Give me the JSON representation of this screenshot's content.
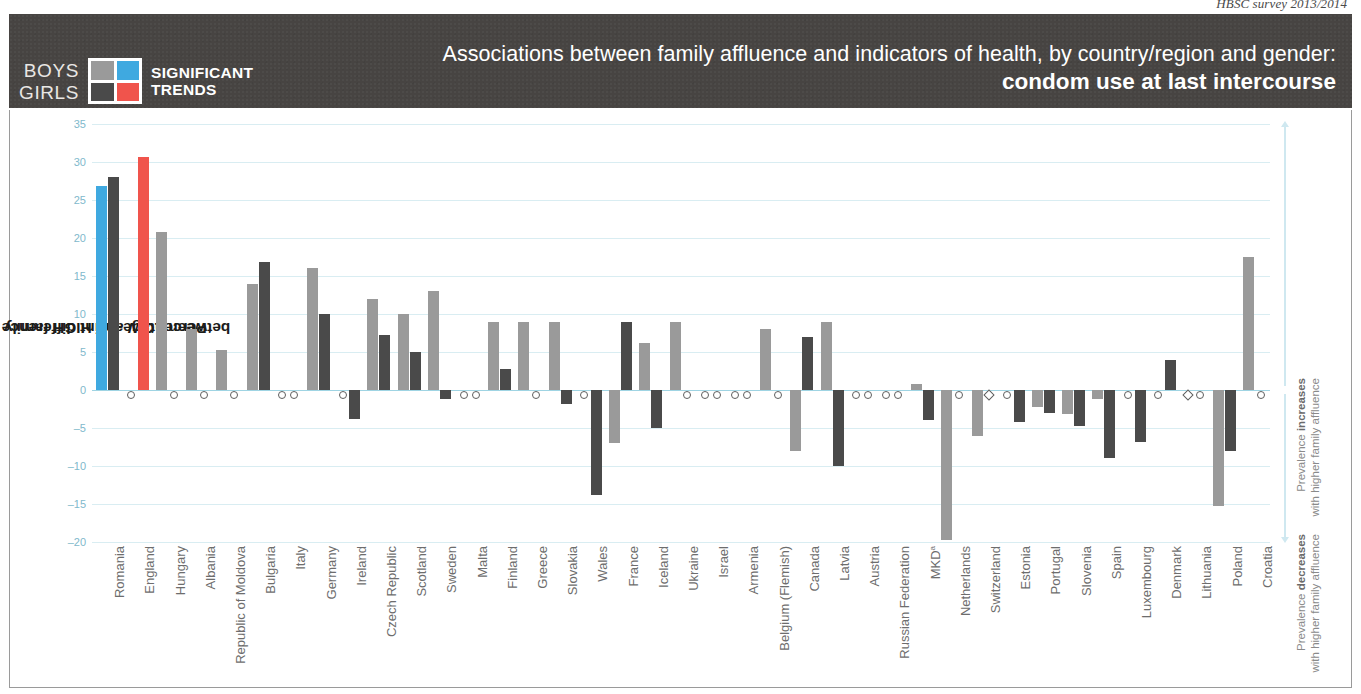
{
  "source_note": "HBSC survey 2013/2014",
  "title": {
    "main": "Associations between family affluence and indicators of health, by country/region and gender:",
    "subject": "condom use at last intercourse"
  },
  "legend": {
    "row_labels": [
      "BOYS",
      "GIRLS"
    ],
    "caption": [
      "SIGNIFICANT",
      "TRENDS"
    ],
    "swatches": {
      "boys_nonsignificant": "#9a9a9a",
      "boys_significant": "#3fa9e0",
      "girls_nonsignificant": "#4a4a4a",
      "girls_significant": "#f0544c"
    }
  },
  "annotations": {
    "increase": "Prevalence <b>increases</b><br>with higher family affluence",
    "decrease": "Prevalence <b>decreases</b><br>with higher family affluence"
  },
  "chart_data": {
    "type": "bar",
    "title": "Associations between family affluence and indicators of health, by country/region and gender: condom use at last intercourse",
    "ylabel_line1": "Percentage-point difference in prevalence",
    "ylabel_line2": "between LOW and HIGH family affluence groups",
    "xlabel": "",
    "ylim": [
      -20,
      35
    ],
    "yticks": [
      35,
      30,
      25,
      20,
      15,
      10,
      5,
      0,
      -5,
      -10,
      -15,
      -20
    ],
    "grid": true,
    "legend_position": "header",
    "categories": [
      "Romania",
      "England",
      "Hungary",
      "Albania",
      "Republic of Moldova",
      "Bulgaria",
      "Italy",
      "Germany",
      "Ireland",
      "Czech Republic",
      "Scotland",
      "Sweden",
      "Malta",
      "Finland",
      "Greece",
      "Slovakia",
      "Wales",
      "France",
      "Iceland",
      "Ukraine",
      "Israel",
      "Armenia",
      "Belgium (Flemish)",
      "Canada",
      "Latvia",
      "Austria",
      "Russian Federation",
      "MKD",
      "Netherlands",
      "Switzerland",
      "Estonia",
      "Portugal",
      "Slovenia",
      "Spain",
      "Luxembourg",
      "Denmark",
      "Lithuania",
      "Poland",
      "Croatia"
    ],
    "category_footnotes": {
      "MKD": "a"
    },
    "series": [
      {
        "name": "Boys",
        "values": [
          26.8,
          0,
          20.8,
          8.0,
          5.2,
          14.0,
          0,
          16.0,
          0,
          12.0,
          10.0,
          13.0,
          0,
          9.0,
          9.0,
          9.0,
          0,
          -7.0,
          6.2,
          9.0,
          0,
          0,
          8.0,
          -8.0,
          9.0,
          0,
          0,
          0.8,
          -19.8,
          -6.0,
          0,
          -2.2,
          -3.2,
          -1.2,
          0,
          0,
          0,
          -15.2,
          17.5
        ],
        "significant": [
          true,
          false,
          false,
          false,
          false,
          false,
          false,
          false,
          false,
          false,
          false,
          false,
          false,
          false,
          false,
          false,
          false,
          false,
          false,
          false,
          false,
          false,
          false,
          false,
          false,
          false,
          false,
          false,
          false,
          false,
          false,
          false,
          false,
          false,
          false,
          false,
          false,
          false,
          false
        ],
        "markers": [
          "",
          "circle",
          "",
          "",
          "",
          "",
          "circle",
          "",
          "circle",
          "",
          "",
          "",
          "circle",
          "",
          "",
          "",
          "circle",
          "",
          "",
          "",
          "circle",
          "circle",
          "",
          "",
          "",
          "circle",
          "circle",
          "",
          "",
          "",
          "circle",
          "",
          "",
          "",
          "circle",
          "circle",
          "diamond",
          "",
          ""
        ]
      },
      {
        "name": "Girls",
        "values": [
          28.0,
          30.7,
          0,
          0,
          0,
          16.8,
          0,
          10.0,
          -3.8,
          7.2,
          5.0,
          -1.2,
          0,
          2.8,
          0,
          -1.8,
          -13.8,
          9.0,
          -5.0,
          0,
          0,
          0,
          0,
          7.0,
          -10.0,
          0,
          0,
          -4.0,
          0,
          0,
          -4.2,
          -3.0,
          -4.8,
          -9.0,
          -6.8,
          4.0,
          0,
          -8.0,
          0
        ],
        "significant": [
          false,
          true,
          false,
          false,
          false,
          false,
          false,
          false,
          false,
          false,
          false,
          false,
          false,
          false,
          false,
          false,
          false,
          false,
          false,
          false,
          false,
          false,
          false,
          false,
          false,
          false,
          false,
          false,
          false,
          false,
          false,
          false,
          false,
          false,
          false,
          false,
          false,
          false,
          false
        ],
        "markers": [
          "",
          "",
          "circle",
          "circle",
          "circle",
          "",
          "circle",
          "",
          "",
          "",
          "",
          "",
          "circle",
          "",
          "circle",
          "",
          "",
          "",
          "",
          "circle",
          "circle",
          "circle",
          "circle",
          "",
          "",
          "circle",
          "circle",
          "",
          "circle",
          "diamond",
          "",
          "",
          "",
          "",
          "",
          "",
          "circle",
          "",
          "circle"
        ]
      }
    ]
  }
}
